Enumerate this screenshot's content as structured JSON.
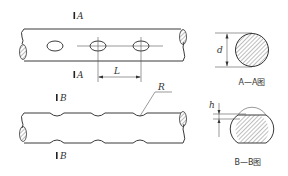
{
  "figure": {
    "top_view": {
      "section_marks": {
        "top": "A",
        "bottom": "A"
      },
      "dimension_label": "L",
      "hole_count": 3
    },
    "section_a": {
      "dimension_label": "d",
      "caption": "A—A图"
    },
    "bottom_view": {
      "section_marks": {
        "top": "B",
        "bottom": "B"
      },
      "radius_label": "R",
      "notch_count": 3
    },
    "section_b": {
      "dimension_label": "h",
      "caption": "B—B图"
    }
  },
  "colors": {
    "line": "#3a3a3a",
    "background": "#ffffff"
  }
}
